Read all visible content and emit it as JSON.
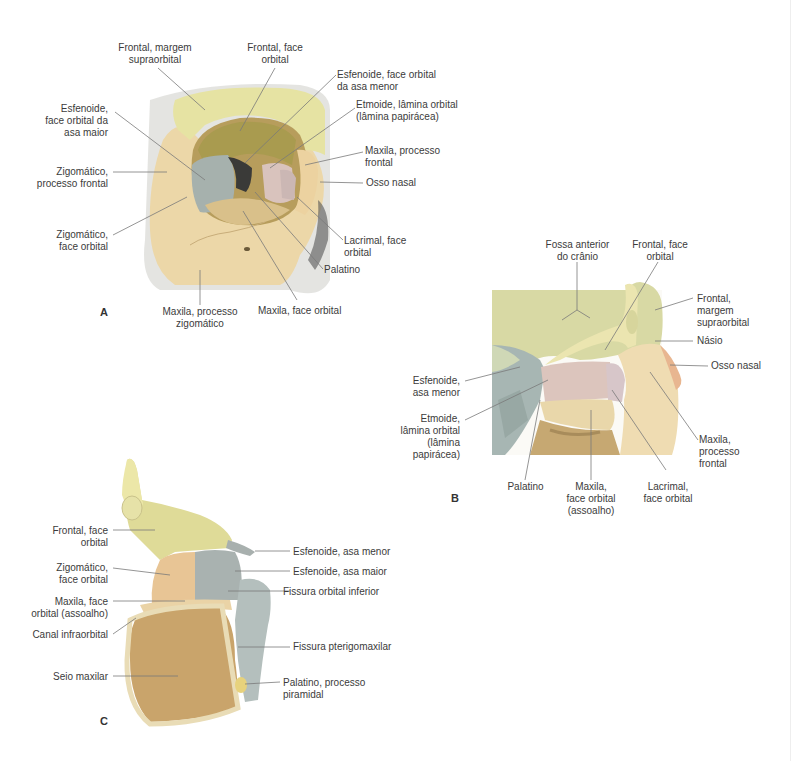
{
  "figures": [
    {
      "id": "A",
      "letter": "A",
      "labels": [
        {
          "text": "Frontal, margem\nsupraorbital"
        },
        {
          "text": "Frontal, face\norbital"
        },
        {
          "text": "Esfenoide, face orbital\nda asa menor"
        },
        {
          "text": "Etmoide, lâmina orbital\n(lâmina papirácea)"
        },
        {
          "text": "Esfenoide,\nface orbital da\nasa maior"
        },
        {
          "text": "Maxila, processo\nfrontal"
        },
        {
          "text": "Zigomático,\nprocesso frontal"
        },
        {
          "text": "Osso nasal"
        },
        {
          "text": "Zigomático,\nface orbital"
        },
        {
          "text": "Lacrimal, face\norbital"
        },
        {
          "text": "Palatino"
        },
        {
          "text": "Maxila, processo\nzigomático"
        },
        {
          "text": "Maxila, face orbital"
        }
      ]
    },
    {
      "id": "B",
      "letter": "B",
      "labels": [
        {
          "text": "Fossa anterior\ndo crânio"
        },
        {
          "text": "Frontal, face\norbital"
        },
        {
          "text": "Frontal,\nmargem\nsupraorbital"
        },
        {
          "text": "Násio"
        },
        {
          "text": "Osso nasal"
        },
        {
          "text": "Esfenoide,\nasa menor"
        },
        {
          "text": "Etmoide,\nlâmina orbital\n(lâmina\npapirácea)"
        },
        {
          "text": "Maxila,\nprocesso\nfrontal"
        },
        {
          "text": "Palatino"
        },
        {
          "text": "Maxila,\nface orbital\n(assoalho)"
        },
        {
          "text": "Lacrimal,\nface orbital"
        }
      ]
    },
    {
      "id": "C",
      "letter": "C",
      "labels": [
        {
          "text": "Frontal, face\norbital"
        },
        {
          "text": "Esfenoide, asa menor"
        },
        {
          "text": "Zigomático,\nface orbital"
        },
        {
          "text": "Esfenoide, asa maior"
        },
        {
          "text": "Maxila, face\norbital (assoalho)"
        },
        {
          "text": "Fissura orbital inferior"
        },
        {
          "text": "Canal infraorbital"
        },
        {
          "text": "Fissura pterigomaxilar"
        },
        {
          "text": "Seio maxilar"
        },
        {
          "text": "Palatino, processo\npiramidal"
        }
      ]
    }
  ],
  "colors": {
    "frontal": "#e6e3a3",
    "zygomatic_maxilla": "#ecd7a8",
    "sphenoid": "#a6b1ad",
    "ethmoid": "#d9c3bd",
    "lacrimal": "#d9c7c6",
    "nasal": "#edc9a6",
    "sinus": "#c9a46b",
    "leader": "#7a7a7a"
  }
}
